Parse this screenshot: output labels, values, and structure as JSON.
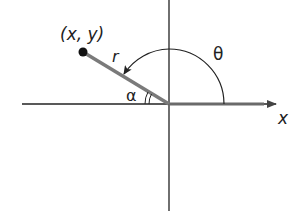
{
  "diagram": {
    "point_label": "(x, y)",
    "radius_label": "r",
    "theta_label": "θ",
    "alpha_label": "α",
    "x_axis_label": "x",
    "colors": {
      "axis": "#222222",
      "ray": "#7a7a7a",
      "point": "#111111"
    }
  }
}
